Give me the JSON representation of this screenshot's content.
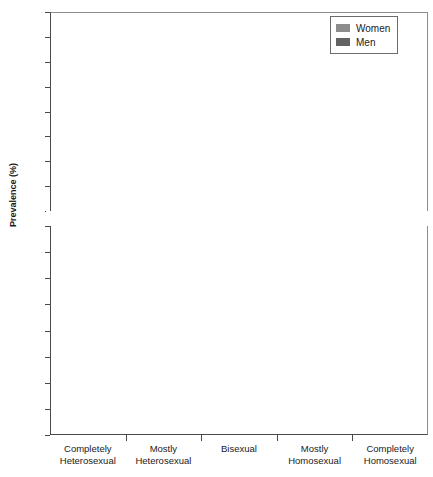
{
  "chart_data": {
    "type": "bar",
    "title": "",
    "xlabel": "",
    "ylabel": "Prevalence (%)",
    "categories": [
      "Completely\nHeterosexual",
      "Mostly\nHeterosexual",
      "Bisexual",
      "Mostly\nHomosexual",
      "Completely\nHomosexual"
    ],
    "category_lines": [
      [
        "Completely",
        "Heterosexual"
      ],
      [
        "Mostly",
        "Heterosexual"
      ],
      [
        "Bisexual",
        ""
      ],
      [
        "Mostly",
        "Homosexual"
      ],
      [
        "Completely",
        "Homosexual"
      ]
    ],
    "series": [
      {
        "name": "Women",
        "color": "#8c8c8c",
        "values": [
          86.8,
          10.1,
          1.5,
          0.5,
          0.7
        ]
      },
      {
        "name": "Men",
        "color": "#636363",
        "values": [
          93.2,
          3.8,
          0.7,
          0.8,
          1.5
        ]
      }
    ],
    "legend_position": "top-right",
    "grid": true,
    "broken_axis": true,
    "axis_lower": {
      "min": 0,
      "max": 16,
      "step": 2
    },
    "axis_upper": {
      "min": 84,
      "max": 100,
      "step": 2
    },
    "ticks_lower": [
      0,
      2,
      4,
      6,
      8,
      10,
      12,
      14,
      16
    ],
    "ticks_upper": [
      84,
      86,
      88,
      90,
      92,
      94,
      96,
      98,
      100
    ]
  },
  "legend": {
    "items": [
      {
        "label": "Women"
      },
      {
        "label": "Men"
      }
    ]
  }
}
